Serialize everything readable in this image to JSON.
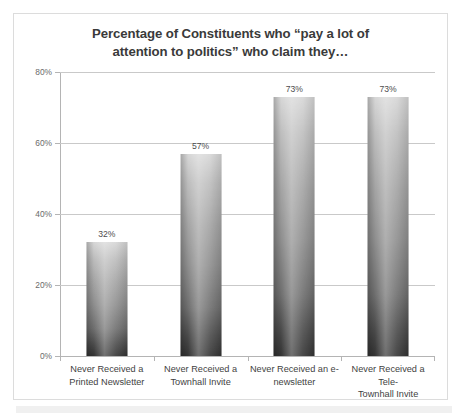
{
  "chart_data": {
    "type": "bar",
    "title": "Percentage of Constituents who “pay a lot of attention to politics” who claim they…",
    "title_lines": [
      "Percentage of Constituents who “pay a lot of",
      "attention to politics” who claim they…"
    ],
    "categories": [
      "Never Received a Printed Newsletter",
      "Never Received a Townhall Invite",
      "Never Received an e-newsletter",
      "Never Received a Tele-Townhall Invite"
    ],
    "category_lines": [
      [
        "Never Received a",
        "Printed Newsletter"
      ],
      [
        "Never Received a",
        "Townhall Invite"
      ],
      [
        "Never Received an e-",
        "newsletter"
      ],
      [
        "Never Received a Tele-",
        "Townhall Invite"
      ]
    ],
    "values": [
      32,
      57,
      73,
      73
    ],
    "data_labels": [
      "32%",
      "57%",
      "73%",
      "73%"
    ],
    "xlabel": "",
    "ylabel": "",
    "ylim": [
      0,
      80
    ],
    "ytick_values": [
      0,
      20,
      40,
      60,
      80
    ],
    "ytick_labels": [
      "0%",
      "20%",
      "40%",
      "60%",
      "80%"
    ],
    "grid": "horizontal",
    "legend": "none",
    "series": [
      {
        "name": "Percentage",
        "values": [
          32,
          57,
          73,
          73
        ]
      }
    ]
  },
  "style": {
    "bar_top_color": "#d6d6d6",
    "bar_bottom_color": "#333333",
    "gridline_color": "#c9c9c9",
    "axis_color": "#b4b4b4",
    "title_color": "#3a3a3a",
    "tick_label_color": "#6b6b6b",
    "category_label_color": "#3f3f3f",
    "data_label_color": "#4d4d4d",
    "frame_border_color": "#dcdcdc",
    "background_color": "#ffffff",
    "strip_color": "#f0f0f0"
  }
}
